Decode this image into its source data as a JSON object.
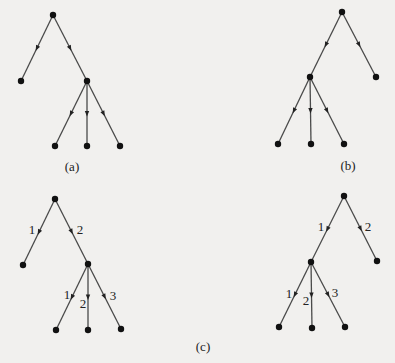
{
  "figure": {
    "panels": [
      {
        "id": "a",
        "caption": "(a)",
        "caption_pos": [
          72,
          166
        ],
        "nodes": [
          [
            53,
            15
          ],
          [
            21,
            81
          ],
          [
            87,
            81
          ],
          [
            55,
            146
          ],
          [
            87,
            146
          ],
          [
            120,
            146
          ]
        ],
        "edges": [
          [
            0,
            1
          ],
          [
            0,
            2
          ],
          [
            2,
            3
          ],
          [
            2,
            4
          ],
          [
            2,
            5
          ]
        ],
        "edge_labels": []
      },
      {
        "id": "b",
        "caption": "(b)",
        "caption_pos": [
          348,
          165
        ],
        "nodes": [
          [
            342,
            12
          ],
          [
            310,
            77
          ],
          [
            376,
            77
          ],
          [
            278,
            144
          ],
          [
            311,
            144
          ],
          [
            344,
            144
          ]
        ],
        "edges": [
          [
            0,
            1
          ],
          [
            0,
            2
          ],
          [
            1,
            3
          ],
          [
            1,
            4
          ],
          [
            1,
            5
          ]
        ],
        "edge_labels": []
      },
      {
        "id": "c-left",
        "caption": "",
        "nodes": [
          [
            55,
            199
          ],
          [
            23,
            265
          ],
          [
            88,
            264
          ],
          [
            56,
            330
          ],
          [
            88,
            330
          ],
          [
            121,
            329
          ]
        ],
        "edges": [
          [
            0,
            1
          ],
          [
            0,
            2
          ],
          [
            2,
            3
          ],
          [
            2,
            4
          ],
          [
            2,
            5
          ]
        ],
        "edge_labels": [
          {
            "text": "1",
            "pos": [
              32,
              229
            ]
          },
          {
            "text": "2",
            "pos": [
              80,
              229
            ]
          },
          {
            "text": "1",
            "pos": [
              67,
              294
            ]
          },
          {
            "text": "2",
            "pos": [
              83,
              303
            ]
          },
          {
            "text": "3",
            "pos": [
              113,
              295
            ]
          }
        ]
      },
      {
        "id": "c-right",
        "caption": "",
        "nodes": [
          [
            344,
            196
          ],
          [
            311,
            262
          ],
          [
            377,
            261
          ],
          [
            279,
            327
          ],
          [
            312,
            328
          ],
          [
            345,
            327
          ]
        ],
        "edges": [
          [
            0,
            1
          ],
          [
            0,
            2
          ],
          [
            1,
            3
          ],
          [
            1,
            4
          ],
          [
            1,
            5
          ]
        ],
        "edge_labels": [
          {
            "text": "1",
            "pos": [
              321,
              226
            ]
          },
          {
            "text": "2",
            "pos": [
              368,
              226
            ]
          },
          {
            "text": "1",
            "pos": [
              289,
              293
            ]
          },
          {
            "text": "2",
            "pos": [
              306,
              300
            ]
          },
          {
            "text": "3",
            "pos": [
              335,
              292
            ]
          }
        ]
      }
    ],
    "shared_caption": {
      "text": "(c)",
      "pos": [
        203,
        346
      ]
    }
  }
}
